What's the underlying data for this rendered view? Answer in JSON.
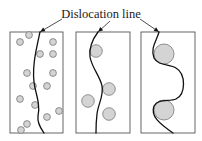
{
  "figure": {
    "label": "Dislocation line",
    "colors": {
      "particle_fill": "#d4d4d4",
      "particle_stroke": "#777777",
      "line": "#111111",
      "frame": "#555555"
    },
    "panels": [
      {
        "name": "fine-dispersed-particles",
        "frame": {
          "x": 10,
          "y": 32,
          "w": 53,
          "h": 101
        },
        "particle_radius": 3.4,
        "particles": [
          [
            29,
            35
          ],
          [
            20,
            42
          ],
          [
            53,
            42
          ],
          [
            40,
            54
          ],
          [
            53,
            54
          ],
          [
            27,
            73
          ],
          [
            53,
            73
          ],
          [
            33,
            86
          ],
          [
            47,
            86
          ],
          [
            20,
            99
          ],
          [
            35,
            105
          ],
          [
            59,
            111
          ],
          [
            47,
            117
          ],
          [
            27,
            124
          ],
          [
            21,
            130
          ]
        ],
        "line_path": "M40,32 C36,50 31,70 35,88 C38,100 40,108 38,116 C37,124 42,130 44,133"
      },
      {
        "name": "medium-particles",
        "frame": {
          "x": 76,
          "y": 32,
          "w": 54,
          "h": 101
        },
        "particle_radius": 6.3,
        "particles": [
          [
            96,
            51
          ],
          [
            109,
            89
          ],
          [
            88,
            101
          ],
          [
            109,
            114
          ]
        ],
        "line_path": "M98,32 C92,40 89,48 90,57 C92,68 100,76 102,86 C104,96 98,104 97,114 C96,122 96,128 96,133"
      },
      {
        "name": "coarse-particles",
        "frame": {
          "x": 141,
          "y": 32,
          "w": 54,
          "h": 101
        },
        "particle_radius": 10,
        "particles": [
          [
            164,
            54
          ],
          [
            164,
            110
          ]
        ],
        "line_path": "M159,32 C157,40 150,48 154,58 C158,66 170,64 176,68 C186,74 186,94 176,99 C170,102 158,98 154,106 C150,116 160,124 173,133"
      }
    ],
    "pointers": [
      {
        "from": [
          62,
          19
        ],
        "to": [
          40,
          32
        ]
      },
      {
        "from": [
          110,
          21
        ],
        "to": [
          98,
          32
        ]
      },
      {
        "from": [
          140,
          19
        ],
        "to": [
          159,
          32
        ]
      }
    ]
  }
}
